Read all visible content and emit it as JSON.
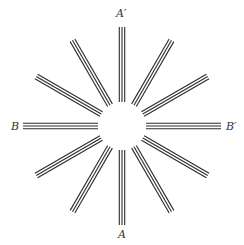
{
  "diagram": {
    "center": [
      122,
      126
    ],
    "inner_radius": 24,
    "outer_radius": 99,
    "spoke_count": 12,
    "angle_step_deg": 30,
    "lines_per_spoke": 3,
    "line_spacing": 2.7,
    "line_color": "#2b2b2b",
    "line_width": 1.1
  },
  "labels": {
    "a_prime": "A′",
    "a": "A",
    "b": "B",
    "b_prime": "B′"
  }
}
